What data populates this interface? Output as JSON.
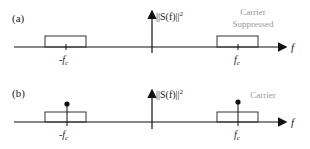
{
  "panels": [
    {
      "label": "(a)",
      "y_axis_label": "||S(f)||",
      "y_axis_exp": "2",
      "x_axis_label": "f",
      "neg_tick": "-f",
      "pos_tick": "f",
      "tick_sub": "c",
      "annotation_line1": "Carrier",
      "annotation_line2": "Suppressed"
    },
    {
      "label": "(b)",
      "y_axis_label": "||S(f)||",
      "y_axis_exp": "2",
      "x_axis_label": "f",
      "neg_tick": "-f",
      "pos_tick": "f",
      "tick_sub": "c",
      "annotation_line1": "Carrier"
    }
  ]
}
